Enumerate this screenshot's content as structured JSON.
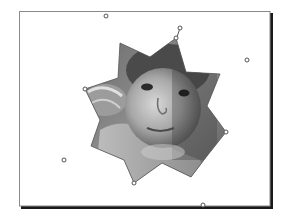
{
  "document": {
    "page": {
      "x": 19,
      "y": 11,
      "width": 251,
      "height": 195,
      "border_color": "#8a8a8a",
      "shadow_color": "#1a1a1a",
      "fill": "#ffffff"
    },
    "star_shape": {
      "name": "8-point star picture crop",
      "points": [
        [
          176,
          38
        ],
        [
          186,
          72
        ],
        [
          220,
          74
        ],
        [
          207,
          106
        ],
        [
          226,
          132
        ],
        [
          207,
          156
        ],
        [
          191,
          177
        ],
        [
          162,
          163
        ],
        [
          134,
          183
        ],
        [
          124,
          160
        ],
        [
          91,
          146
        ],
        [
          100,
          120
        ],
        [
          85,
          89
        ],
        [
          118,
          78
        ],
        [
          120,
          43
        ],
        [
          150,
          57
        ]
      ],
      "outline_color": "#555555"
    },
    "photo": {
      "subject": "child face, grayscale",
      "colors": {
        "light": "#d9d9d9",
        "mid": "#9a9a9a",
        "dark": "#3a3a3a"
      }
    },
    "vertex_handles": [
      [
        176,
        38
      ],
      [
        85,
        89
      ],
      [
        226,
        132
      ],
      [
        134,
        183
      ]
    ],
    "rotation_handle": {
      "x": 180,
      "y": 28,
      "anchor_x": 177,
      "anchor_y": 37
    },
    "bounding_handles": [
      [
        106,
        16
      ],
      [
        247,
        60
      ],
      [
        64,
        160
      ],
      [
        203,
        205
      ]
    ]
  }
}
